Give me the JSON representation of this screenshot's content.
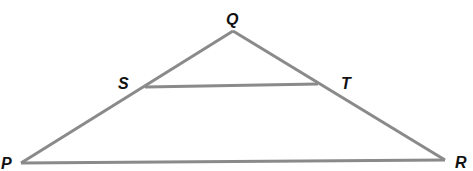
{
  "diagram": {
    "type": "triangle-with-segment",
    "line_color": "#8a8a8a",
    "label_color": "#111111",
    "points": {
      "P": {
        "label": "P",
        "x": 21,
        "y": 163
      },
      "Q": {
        "label": "Q",
        "x": 233,
        "y": 31
      },
      "R": {
        "label": "R",
        "x": 445,
        "y": 160
      },
      "S": {
        "label": "S",
        "x": 145,
        "y": 87
      },
      "T": {
        "label": "T",
        "x": 318,
        "y": 84
      }
    },
    "segments": [
      "PQ",
      "QR",
      "PR",
      "ST"
    ]
  }
}
